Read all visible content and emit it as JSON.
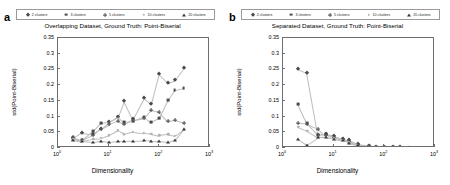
{
  "figure": {
    "width": 450,
    "height": 185,
    "background": "#ffffff"
  },
  "panels": [
    {
      "letter": "a",
      "title": "Overlapping Dataset, Ground Truth: Point-Biserial"
    },
    {
      "letter": "b",
      "title": "Separated Dataset, Ground Truth: Point-Biserial"
    }
  ],
  "legend": {
    "position": "top",
    "entries": [
      {
        "label": "2 clusters",
        "marker": "diamond-marker"
      },
      {
        "label": "3 clusters",
        "marker": "square-marker"
      },
      {
        "label": "5 clusters",
        "marker": "plus-marker"
      },
      {
        "label": "10 clusters",
        "marker": "dot-marker"
      },
      {
        "label": "20 clusters",
        "marker": "triangle-marker"
      }
    ]
  },
  "axes": {
    "ylabel": "std(Point-Biserial)",
    "xlabel": "Dimensionality",
    "yticks": [
      0,
      0.05,
      0.1,
      0.15,
      0.2,
      0.25,
      0.3,
      0.35
    ],
    "ytick_labels": [
      "0",
      "0.05",
      "0.1",
      "0.15",
      "0.2",
      "0.25",
      "0.3",
      "0.35"
    ],
    "ylim": [
      0,
      0.35
    ],
    "xlim": [
      1,
      1000
    ],
    "xscale": "log",
    "xticks": [
      1,
      10,
      100,
      1000
    ],
    "xtick_labels": [
      "10",
      "10",
      "10",
      "10"
    ],
    "xtick_exponents": [
      "0",
      "1",
      "2",
      "3"
    ],
    "grid": false
  },
  "colors": {
    "axis": "#6e6e6e",
    "text": "#000000",
    "line": "#bdbdbd",
    "marker_dark": "#4a4a4a",
    "marker_light": "#b0b0b0"
  },
  "chart_data": [
    {
      "type": "scatter",
      "panel": "a",
      "title": "Overlapping Dataset, Ground Truth: Point-Biserial",
      "xlabel": "Dimensionality",
      "ylabel": "std(Point-Biserial)",
      "xscale": "log",
      "xlim": [
        1,
        1000
      ],
      "ylim": [
        0,
        0.35
      ],
      "grid": false,
      "legend_position": "top",
      "x": [
        2,
        3,
        5,
        7,
        10,
        15,
        20,
        30,
        50,
        70,
        100,
        150,
        200,
        300
      ],
      "series": [
        {
          "name": "2 clusters",
          "marker": "diamond",
          "values": [
            0.031,
            0.049,
            0.044,
            0.062,
            0.082,
            0.098,
            0.15,
            0.092,
            0.16,
            0.14,
            0.236,
            0.208,
            0.215,
            0.253
          ]
        },
        {
          "name": "3 clusters",
          "marker": "square",
          "values": [
            0.028,
            0.024,
            0.055,
            0.08,
            0.084,
            0.1,
            0.082,
            0.085,
            0.1,
            0.082,
            0.095,
            0.153,
            0.184,
            0.19
          ]
        },
        {
          "name": "5 clusters",
          "marker": "plus",
          "values": [
            0.036,
            0.025,
            0.042,
            0.062,
            0.075,
            0.086,
            0.076,
            0.09,
            0.095,
            0.122,
            0.116,
            0.086,
            0.089,
            0.081
          ]
        },
        {
          "name": "10 clusters",
          "marker": "dot",
          "values": [
            0.029,
            0.023,
            0.03,
            0.032,
            0.041,
            0.056,
            0.044,
            0.052,
            0.048,
            0.046,
            0.04,
            0.044,
            0.038,
            0.06
          ]
        },
        {
          "name": "20 clusters",
          "marker": "triangle",
          "values": [
            0.027,
            0.021,
            0.018,
            0.022,
            0.02,
            0.023,
            0.022,
            0.023,
            0.025,
            0.023,
            0.022,
            0.019,
            0.025,
            0.06
          ]
        }
      ]
    },
    {
      "type": "scatter",
      "panel": "b",
      "title": "Separated Dataset, Ground Truth: Point-Biserial",
      "xlabel": "Dimensionality",
      "ylabel": "std(Point-Biserial)",
      "xscale": "log",
      "xlim": [
        1,
        1000
      ],
      "ylim": [
        0,
        0.35
      ],
      "grid": false,
      "legend_position": "top",
      "x": [
        2,
        3,
        5,
        7,
        10,
        15,
        20,
        30,
        50,
        70,
        100,
        150,
        200,
        300
      ],
      "series": [
        {
          "name": "2 clusters",
          "marker": "diamond",
          "values": [
            0.252,
            0.239,
            0.04,
            0.043,
            0.038,
            0.028,
            0.024,
            0.012,
            0.006,
            0.004,
            0.003,
            0.002,
            0.002,
            0.001
          ]
        },
        {
          "name": "3 clusters",
          "marker": "square",
          "values": [
            0.139,
            0.078,
            0.04,
            0.044,
            0.034,
            0.028,
            0.02,
            0.01,
            0.006,
            0.004,
            0.003,
            0.002,
            0.002,
            0.001
          ]
        },
        {
          "name": "5 clusters",
          "marker": "plus",
          "values": [
            0.078,
            0.077,
            0.062,
            0.04,
            0.036,
            0.028,
            0.021,
            0.011,
            0.006,
            0.004,
            0.003,
            0.002,
            0.002,
            0.001
          ]
        },
        {
          "name": "10 clusters",
          "marker": "dot",
          "values": [
            0.067,
            0.055,
            0.034,
            0.036,
            0.031,
            0.026,
            0.019,
            0.01,
            0.005,
            0.004,
            0.003,
            0.002,
            0.002,
            0.001
          ]
        },
        {
          "name": "20 clusters",
          "marker": "triangle",
          "values": [
            0.03,
            0.011,
            0.035,
            0.034,
            0.03,
            0.024,
            0.017,
            0.009,
            0.005,
            0.003,
            0.003,
            0.002,
            0.002,
            0.001
          ]
        }
      ]
    }
  ]
}
